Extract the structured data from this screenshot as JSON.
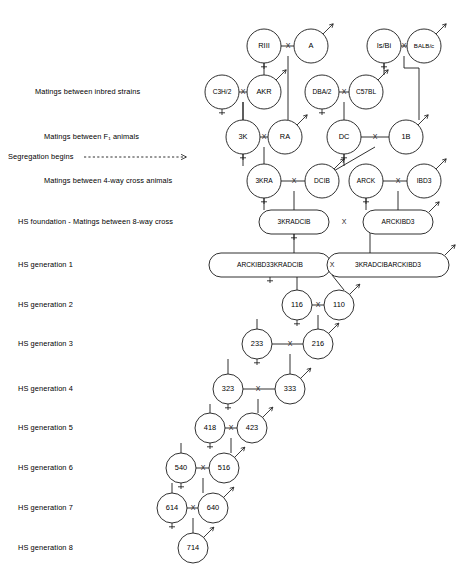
{
  "figure": {
    "background": "#ffffff",
    "ink": "#1a1a1a"
  },
  "row_labels": [
    {
      "id": "inbred",
      "text": "Matings between inbred strains",
      "x": 35,
      "y": 92
    },
    {
      "id": "f1",
      "text": "Matings between F₁ animals",
      "x": 44,
      "y": 137
    },
    {
      "id": "segregation",
      "text": "Segregation begins",
      "x": 8,
      "y": 157
    },
    {
      "id": "fourway",
      "text": "Matings between 4-way cross animals",
      "x": 44,
      "y": 181
    },
    {
      "id": "hsfound",
      "text": "HS foundation - Matings between 8-way cross",
      "x": 18,
      "y": 222
    },
    {
      "id": "gen1",
      "text": "HS generation 1",
      "x": 18,
      "y": 265
    },
    {
      "id": "gen2",
      "text": "HS generation 2",
      "x": 18,
      "y": 305
    },
    {
      "id": "gen3",
      "text": "HS generation 3",
      "x": 18,
      "y": 344
    },
    {
      "id": "gen4",
      "text": "HS generation 4",
      "x": 18,
      "y": 389
    },
    {
      "id": "gen5",
      "text": "HS generation 5",
      "x": 18,
      "y": 428
    },
    {
      "id": "gen6",
      "text": "HS generation 6",
      "x": 18,
      "y": 468
    },
    {
      "id": "gen7",
      "text": "HS generation 7",
      "x": 18,
      "y": 508
    },
    {
      "id": "gen8",
      "text": "HS generation 8",
      "x": 18,
      "y": 548
    }
  ],
  "segregation_arrow": {
    "x1": 84,
    "x2": 186,
    "y": 157
  },
  "nodes": [
    {
      "id": "RIII",
      "label": "RIII",
      "shape": "circle",
      "cx": 264,
      "cy": 46,
      "r": 17,
      "sex": "female",
      "size": "n"
    },
    {
      "id": "A",
      "label": "A",
      "shape": "circle",
      "cx": 311,
      "cy": 46,
      "r": 17,
      "sex": "male",
      "size": "n"
    },
    {
      "id": "IsBi",
      "label": "Is/Bi",
      "shape": "circle",
      "cx": 384,
      "cy": 46,
      "r": 17,
      "sex": "female",
      "size": "n"
    },
    {
      "id": "BALBc",
      "label": "BALB/c",
      "shape": "circle",
      "cx": 424,
      "cy": 46,
      "r": 17,
      "sex": "male",
      "size": "xs"
    },
    {
      "id": "C3H2",
      "label": "C3H/2",
      "shape": "circle",
      "cx": 222,
      "cy": 92,
      "r": 17,
      "sex": "female",
      "size": "sm"
    },
    {
      "id": "AKR",
      "label": "AKR",
      "shape": "circle",
      "cx": 264,
      "cy": 92,
      "r": 17,
      "sex": "male",
      "size": "n"
    },
    {
      "id": "DBA2",
      "label": "DBA/2",
      "shape": "circle",
      "cx": 322,
      "cy": 92,
      "r": 17,
      "sex": "female",
      "size": "sm"
    },
    {
      "id": "C57BL",
      "label": "C57BL",
      "shape": "circle",
      "cx": 366,
      "cy": 92,
      "r": 17,
      "sex": "male",
      "size": "sm"
    },
    {
      "id": "3K",
      "label": "3K",
      "shape": "circle",
      "cx": 243,
      "cy": 137,
      "r": 17,
      "sex": "female",
      "size": "n"
    },
    {
      "id": "RA",
      "label": "RA",
      "shape": "circle",
      "cx": 285,
      "cy": 137,
      "r": 17,
      "sex": "male",
      "size": "n"
    },
    {
      "id": "DC",
      "label": "DC",
      "shape": "circle",
      "cx": 344,
      "cy": 137,
      "r": 17,
      "sex": "female",
      "size": "n"
    },
    {
      "id": "1B",
      "label": "1B",
      "shape": "circle",
      "cx": 406,
      "cy": 137,
      "r": 17,
      "sex": "male",
      "size": "n"
    },
    {
      "id": "3KRA",
      "label": "3KRA",
      "shape": "circle",
      "cx": 264,
      "cy": 181,
      "r": 17,
      "sex": "female",
      "size": "sm"
    },
    {
      "id": "DCIB",
      "label": "DCIB",
      "shape": "circle",
      "cx": 322,
      "cy": 181,
      "r": 17,
      "sex": "male",
      "size": "sm"
    },
    {
      "id": "ARCK",
      "label": "ARCK",
      "shape": "circle",
      "cx": 366,
      "cy": 181,
      "r": 17,
      "sex": "female",
      "size": "sm"
    },
    {
      "id": "IBD3",
      "label": "IBD3",
      "shape": "circle",
      "cx": 424,
      "cy": 181,
      "r": 17,
      "sex": "male",
      "size": "sm"
    },
    {
      "id": "3KRADCIB",
      "label": "3KRADCIB",
      "shape": "pill",
      "cx": 294,
      "cy": 222,
      "w": 70,
      "h": 24,
      "sex": "female",
      "size": "sm"
    },
    {
      "id": "ARCKIBD3",
      "label": "ARCKIBD3",
      "shape": "pill",
      "cx": 398,
      "cy": 222,
      "w": 70,
      "h": 24,
      "sex": "male",
      "size": "sm"
    },
    {
      "id": "ARCKIBD33KRADCIB",
      "label": "ARCKIBD33KRADCIB",
      "shape": "pill",
      "cx": 270,
      "cy": 265,
      "w": 122,
      "h": 24,
      "sex": "female",
      "size": "sm"
    },
    {
      "id": "3KRADCIBARCKIBD3",
      "label": "3KRADCIBARCKIBD3",
      "shape": "pill",
      "cx": 388,
      "cy": 265,
      "w": 122,
      "h": 24,
      "sex": "male",
      "size": "sm"
    },
    {
      "id": "116",
      "label": "116",
      "shape": "circle",
      "cx": 297,
      "cy": 305,
      "r": 15,
      "sex": "female",
      "size": "n"
    },
    {
      "id": "110",
      "label": "110",
      "shape": "circle",
      "cx": 339,
      "cy": 305,
      "r": 15,
      "sex": "male",
      "size": "n"
    },
    {
      "id": "233",
      "label": "233",
      "shape": "circle",
      "cx": 257,
      "cy": 344,
      "r": 15,
      "sex": "female",
      "size": "n"
    },
    {
      "id": "216",
      "label": "216",
      "shape": "circle",
      "cx": 318,
      "cy": 344,
      "r": 15,
      "sex": "male",
      "size": "n"
    },
    {
      "id": "323",
      "label": "323",
      "shape": "circle",
      "cx": 228,
      "cy": 389,
      "r": 15,
      "sex": "female",
      "size": "n"
    },
    {
      "id": "333",
      "label": "333",
      "shape": "circle",
      "cx": 290,
      "cy": 389,
      "r": 15,
      "sex": "male",
      "size": "n"
    },
    {
      "id": "418",
      "label": "418",
      "shape": "circle",
      "cx": 210,
      "cy": 428,
      "r": 15,
      "sex": "female",
      "size": "n"
    },
    {
      "id": "423",
      "label": "423",
      "shape": "circle",
      "cx": 252,
      "cy": 428,
      "r": 15,
      "sex": "male",
      "size": "n"
    },
    {
      "id": "540",
      "label": "540",
      "shape": "circle",
      "cx": 181,
      "cy": 468,
      "r": 15,
      "sex": "female",
      "size": "n"
    },
    {
      "id": "516",
      "label": "516",
      "shape": "circle",
      "cx": 224,
      "cy": 468,
      "r": 15,
      "sex": "male",
      "size": "n"
    },
    {
      "id": "614",
      "label": "614",
      "shape": "circle",
      "cx": 172,
      "cy": 508,
      "r": 15,
      "sex": "female",
      "size": "n"
    },
    {
      "id": "640",
      "label": "640",
      "shape": "circle",
      "cx": 213,
      "cy": 508,
      "r": 15,
      "sex": "male",
      "size": "n"
    },
    {
      "id": "714",
      "label": "714",
      "shape": "circle",
      "cx": 193,
      "cy": 548,
      "r": 15,
      "sex": "male",
      "size": "n"
    }
  ],
  "crosses": [
    {
      "id": "x-riii-a",
      "symbol": "X",
      "x": 288,
      "y": 46
    },
    {
      "id": "x-isbi-balbc",
      "symbol": "X",
      "x": 404,
      "y": 46
    },
    {
      "id": "x-c3h2-akr",
      "symbol": "X",
      "x": 243,
      "y": 92
    },
    {
      "id": "x-dba2-c57bl",
      "symbol": "X",
      "x": 344,
      "y": 92
    },
    {
      "id": "x-3k-ra",
      "symbol": "X",
      "x": 264,
      "y": 137
    },
    {
      "id": "x-dc-1b",
      "symbol": "X",
      "x": 375,
      "y": 137
    },
    {
      "id": "x-3kra-dcib",
      "symbol": "X",
      "x": 294,
      "y": 181
    },
    {
      "id": "x-arck-ibd3",
      "symbol": "X",
      "x": 398,
      "y": 181
    },
    {
      "id": "x-8way",
      "symbol": "X",
      "x": 344,
      "y": 222
    },
    {
      "id": "x-gen1",
      "symbol": "X",
      "x": 332,
      "y": 265
    },
    {
      "id": "x-116-110",
      "symbol": "X",
      "x": 318,
      "y": 305
    },
    {
      "id": "x-233-216",
      "symbol": "X",
      "x": 290,
      "y": 344
    },
    {
      "id": "x-323-333",
      "symbol": "X",
      "x": 258,
      "y": 389
    },
    {
      "id": "x-418-423",
      "symbol": "X",
      "x": 231,
      "y": 428
    },
    {
      "id": "x-540-516",
      "symbol": "X",
      "x": 203,
      "y": 468
    },
    {
      "id": "x-614-640",
      "symbol": "X",
      "x": 193,
      "y": 508
    }
  ],
  "mating_lines": [
    {
      "id": "m-riii-a",
      "from": "RIII",
      "to": "A",
      "path": "M 281 46 L 295 46"
    },
    {
      "id": "m-isbi-balbc",
      "from": "IsBi",
      "to": "BALBc",
      "path": "M 401 46 L 407 46"
    },
    {
      "id": "m-c3h2-akr",
      "from": "C3H2",
      "to": "AKR",
      "path": "M 239 92 L 247 92"
    },
    {
      "id": "m-dba2-c57bl",
      "from": "DBA2",
      "to": "C57BL",
      "path": "M 339 92 L 349 92"
    },
    {
      "id": "m-3k-ra",
      "from": "3K",
      "to": "RA",
      "path": "M 260 137 L 268 137"
    },
    {
      "id": "m-dc-1b",
      "from": "DC",
      "to": "1B",
      "path": "M 361 137 L 389 137"
    },
    {
      "id": "m-3kra-dcib",
      "from": "3KRA",
      "to": "DCIB",
      "path": "M 281 181 L 305 181"
    },
    {
      "id": "m-arck-ibd3",
      "from": "ARCK",
      "to": "IBD3",
      "path": "M 383 181 L 407 181"
    },
    {
      "id": "m-116-110",
      "from": "116",
      "to": "110",
      "path": "M 312 305 L 324 305"
    },
    {
      "id": "m-233-216",
      "from": "233",
      "to": "216",
      "path": "M 272 344 L 303 344"
    },
    {
      "id": "m-323-333",
      "from": "323",
      "to": "333",
      "path": "M 243 389 L 275 389"
    },
    {
      "id": "m-418-423",
      "from": "418",
      "to": "423",
      "path": "M 225 428 L 237 428"
    },
    {
      "id": "m-540-516",
      "from": "540",
      "to": "516",
      "path": "M 196 468 L 209 468"
    },
    {
      "id": "m-614-640",
      "from": "614",
      "to": "640",
      "path": "M 187 508 L 198 508"
    }
  ],
  "descent_lines": [
    {
      "id": "d-riii-to-akr",
      "path": "M 264 63 L 264 75"
    },
    {
      "id": "d-a-to-ra",
      "path": "M 288 56 L 288 120"
    },
    {
      "id": "d-isbi-to-c57bl",
      "path": "M 384 63 L 384 75"
    },
    {
      "id": "d-balbc-to-1b",
      "path": "M 404 56 L 404 68 L 419 68 L 419 120"
    },
    {
      "id": "d-c3h2-to-3k",
      "path": "M 243 102 L 243 120"
    },
    {
      "id": "d-akr-3k",
      "path": "M 243 102 L 243 120"
    },
    {
      "id": "d-dba2-to-dc",
      "path": "M 344 102 L 344 120"
    },
    {
      "id": "d-3k-to-3kra",
      "path": "M 243 154 L 243 166"
    },
    {
      "id": "d-ra-to-3kra",
      "path": "M 264 147 L 264 164"
    },
    {
      "id": "d-dc-to-dcib",
      "path": "M 344 154 L 344 166"
    },
    {
      "id": "d-1b-to-dcib",
      "path": "M 375 147 L 332 172"
    },
    {
      "id": "d-3kra-to-8way",
      "path": "M 264 198 L 264 210"
    },
    {
      "id": "d-dcib-to-8way",
      "path": "M 294 191 L 294 210"
    },
    {
      "id": "d-arck-to-8way",
      "path": "M 366 198 L 366 210"
    },
    {
      "id": "d-ibd3-to-8way",
      "path": "M 398 191 L 398 210"
    },
    {
      "id": "d-8way-left-down",
      "path": "M 294 234 L 294 253"
    },
    {
      "id": "d-8way-right-down",
      "path": "M 370 232 L 370 240 L 370 253"
    },
    {
      "id": "d-gen1-to-116",
      "path": "M 297 277 L 297 290"
    },
    {
      "id": "d-gen1-to-110",
      "path": "M 332 275 L 344 290"
    },
    {
      "id": "d-116-to-233",
      "path": "M 257 319 L 257 329"
    },
    {
      "id": "d-110-to-216",
      "path": "M 318 315 L 318 329"
    },
    {
      "id": "d-233-to-323",
      "path": "M 228 359 L 228 374"
    },
    {
      "id": "d-216-to-333",
      "path": "M 290 354 L 290 374"
    },
    {
      "id": "d-323-to-418",
      "path": "M 210 404 L 210 413"
    },
    {
      "id": "d-333-to-423",
      "path": "M 258 399 L 258 413"
    },
    {
      "id": "d-418-to-540",
      "path": "M 181 443 L 181 453"
    },
    {
      "id": "d-423-to-516",
      "path": "M 231 438 L 231 453"
    },
    {
      "id": "d-540-to-614",
      "path": "M 172 483 L 172 493"
    },
    {
      "id": "d-516-to-640",
      "path": "M 203 478 L 203 493"
    },
    {
      "id": "d-640-to-714",
      "path": "M 193 518 L 193 533"
    }
  ],
  "legend_symbols": {
    "female": "♀",
    "male": "♂",
    "cross": "X"
  }
}
